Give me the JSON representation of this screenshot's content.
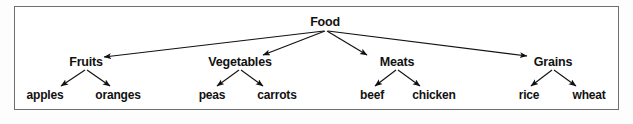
{
  "figure": {
    "kind": "hierarchy-tree-diagram",
    "border_color": "#6e6e6e",
    "background_color": "#ffffff",
    "line_color": "#111111",
    "text_color": "#111111"
  },
  "tree": {
    "root": {
      "label": "Food",
      "x": 325,
      "y": 22
    },
    "categories": [
      {
        "label": "Fruits",
        "x": 86,
        "y": 62
      },
      {
        "label": "Vegetables",
        "x": 240,
        "y": 62
      },
      {
        "label": "Meats",
        "x": 397,
        "y": 62
      },
      {
        "label": "Grains",
        "x": 553,
        "y": 62
      }
    ],
    "leaves": [
      {
        "label": "apples",
        "parent": "Fruits",
        "x": 45,
        "y": 95
      },
      {
        "label": "oranges",
        "parent": "Fruits",
        "x": 118,
        "y": 95
      },
      {
        "label": "peas",
        "parent": "Vegetables",
        "x": 212,
        "y": 95
      },
      {
        "label": "carrots",
        "parent": "Vegetables",
        "x": 277,
        "y": 95
      },
      {
        "label": "beef",
        "parent": "Meats",
        "x": 372,
        "y": 95
      },
      {
        "label": "chicken",
        "parent": "Meats",
        "x": 434,
        "y": 95
      },
      {
        "label": "rice",
        "parent": "Grains",
        "x": 529,
        "y": 95
      },
      {
        "label": "wheat",
        "parent": "Grains",
        "x": 589,
        "y": 95
      }
    ],
    "edges": [
      {
        "from": "Food",
        "to": "Fruits",
        "x1": 324,
        "y1": 31,
        "x2": 104,
        "y2": 57
      },
      {
        "from": "Food",
        "to": "Vegetables",
        "x1": 325,
        "y1": 31,
        "x2": 263,
        "y2": 55
      },
      {
        "from": "Food",
        "to": "Meats",
        "x1": 327,
        "y1": 31,
        "x2": 367,
        "y2": 55
      },
      {
        "from": "Food",
        "to": "Grains",
        "x1": 328,
        "y1": 31,
        "x2": 527,
        "y2": 56
      },
      {
        "from": "Fruits",
        "to": "apples",
        "x1": 85,
        "y1": 70,
        "x2": 61,
        "y2": 86
      },
      {
        "from": "Fruits",
        "to": "oranges",
        "x1": 87,
        "y1": 70,
        "x2": 110,
        "y2": 86
      },
      {
        "from": "Vegetables",
        "to": "peas",
        "x1": 239,
        "y1": 70,
        "x2": 217,
        "y2": 86
      },
      {
        "from": "Vegetables",
        "to": "carrots",
        "x1": 241,
        "y1": 70,
        "x2": 263,
        "y2": 86
      },
      {
        "from": "Meats",
        "to": "beef",
        "x1": 396,
        "y1": 70,
        "x2": 375,
        "y2": 86
      },
      {
        "from": "Meats",
        "to": "chicken",
        "x1": 398,
        "y1": 70,
        "x2": 420,
        "y2": 86
      },
      {
        "from": "Grains",
        "to": "rice",
        "x1": 552,
        "y1": 70,
        "x2": 531,
        "y2": 86
      },
      {
        "from": "Grains",
        "to": "wheat",
        "x1": 554,
        "y1": 70,
        "x2": 576,
        "y2": 86
      }
    ]
  }
}
